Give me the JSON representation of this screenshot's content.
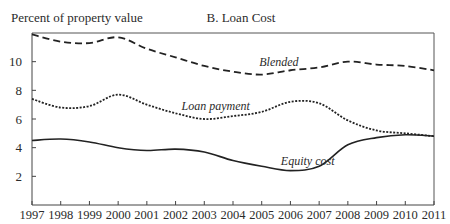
{
  "chart_data": {
    "type": "line",
    "title": "B. Loan Cost",
    "xlabel": "",
    "ylabel": "Percent of property value",
    "x": [
      1997,
      1998,
      1999,
      2000,
      2001,
      2002,
      2003,
      2004,
      2005,
      2006,
      2007,
      2008,
      2009,
      2010,
      2011
    ],
    "xlim": [
      1997,
      2011
    ],
    "ylim": [
      0,
      12
    ],
    "yticks": [
      2,
      4,
      6,
      8,
      10
    ],
    "grid": false,
    "legend": "inline labels",
    "series": [
      {
        "name": "Blended",
        "style": "dashed",
        "values": [
          11.9,
          11.4,
          11.3,
          11.7,
          10.9,
          10.3,
          9.7,
          9.3,
          9.1,
          9.4,
          9.6,
          10.0,
          9.8,
          9.7,
          9.4
        ],
        "label_position": {
          "x": 2005.6,
          "y": 9.7
        }
      },
      {
        "name": "Loan payment",
        "style": "dotted",
        "values": [
          7.4,
          6.8,
          6.9,
          7.7,
          7.0,
          6.4,
          6.0,
          6.2,
          6.5,
          7.2,
          7.1,
          5.9,
          5.2,
          5.0,
          4.8
        ],
        "label_position": {
          "x": 2003.4,
          "y": 6.6
        }
      },
      {
        "name": "Equity cost",
        "style": "solid",
        "values": [
          4.5,
          4.6,
          4.4,
          4.0,
          3.8,
          3.9,
          3.7,
          3.1,
          2.7,
          2.4,
          2.7,
          4.2,
          4.7,
          4.9,
          4.8
        ],
        "label_position": {
          "x": 2006.6,
          "y": 2.8
        }
      }
    ]
  }
}
